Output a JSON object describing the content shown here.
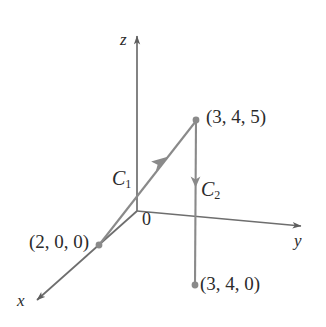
{
  "figure": {
    "type": "3d-coordinate-diagram",
    "background_color": "#ffffff",
    "axis_color": "#6e6e6e",
    "curve_color": "#8a8a8a",
    "point_color": "#8a8a8a",
    "text_color": "#2b2b2b",
    "axes": [
      {
        "name": "x",
        "label": "x",
        "direction": "down-left",
        "tip": [
          33,
          303
        ]
      },
      {
        "name": "y",
        "label": "y",
        "direction": "right",
        "tip": [
          305,
          227
        ]
      },
      {
        "name": "z",
        "label": "z",
        "direction": "up",
        "tip": [
          137,
          32
        ]
      }
    ],
    "origin": {
      "label": "0",
      "position": [
        137,
        210
      ]
    },
    "points": [
      {
        "name": "point-2-0-0",
        "label": "(2, 0, 0)",
        "position": [
          99,
          245
        ]
      },
      {
        "name": "point-3-4-5",
        "label": "(3, 4, 5)",
        "position": [
          196,
          120
        ]
      },
      {
        "name": "point-3-4-0",
        "label": "(3, 4, 0)",
        "position": [
          195,
          285
        ]
      }
    ],
    "curves": [
      {
        "name": "C1",
        "label_text": "C",
        "label_sub": "1",
        "from": "(2, 0, 0)",
        "to": "(3, 4, 5)",
        "arrow_direction": "up-right"
      },
      {
        "name": "C2",
        "label_text": "C",
        "label_sub": "2",
        "from": "(3, 4, 5)",
        "to": "(3, 4, 0)",
        "arrow_direction": "down"
      }
    ]
  }
}
